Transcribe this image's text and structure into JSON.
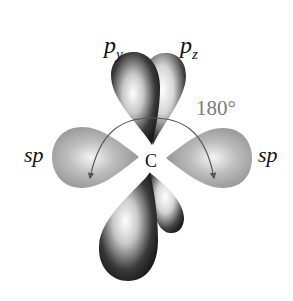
{
  "diagram": {
    "center_atom": "C",
    "angle_label": "180°",
    "labels": {
      "p_y": {
        "base": "p",
        "subscript": "y"
      },
      "p_z": {
        "base": "p",
        "subscript": "z"
      },
      "sp_left": "sp",
      "sp_right": "sp"
    },
    "colors": {
      "sp_lobe": "#a8a8a8",
      "p_lobe_dark": "#2a2a2a",
      "p_lobe_light": "#f2f2f2",
      "arc": "#555555",
      "angle_text": "#7a7a7a",
      "text": "#111111"
    }
  }
}
